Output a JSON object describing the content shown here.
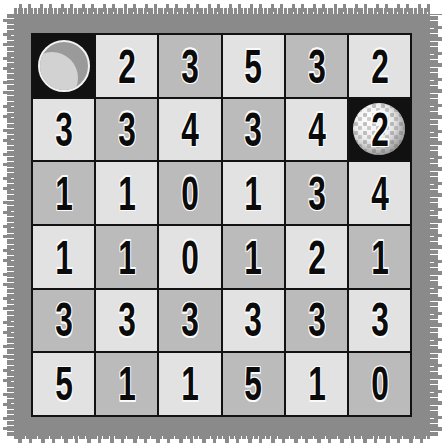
{
  "board": {
    "title": "number-grid-puzzle",
    "rows": 6,
    "columns": 6,
    "colors": {
      "frame": "#8a8a8a",
      "grid_line": "#121212",
      "cell_light": "#e2e2e2",
      "cell_dark": "#bbbbbb",
      "cell_marker_bg": "#111111",
      "digit": "#0b0b0b",
      "page_background": "#ffffff"
    },
    "cells": [
      [
        {
          "value": "",
          "shade": "black",
          "marker": "moon-icon"
        },
        {
          "value": "2",
          "shade": "light",
          "marker": ""
        },
        {
          "value": "3",
          "shade": "dark",
          "marker": ""
        },
        {
          "value": "5",
          "shade": "light",
          "marker": ""
        },
        {
          "value": "3",
          "shade": "dark",
          "marker": ""
        },
        {
          "value": "2",
          "shade": "light",
          "marker": ""
        }
      ],
      [
        {
          "value": "3",
          "shade": "light",
          "marker": ""
        },
        {
          "value": "3",
          "shade": "dark",
          "marker": ""
        },
        {
          "value": "4",
          "shade": "light",
          "marker": ""
        },
        {
          "value": "3",
          "shade": "dark",
          "marker": ""
        },
        {
          "value": "4",
          "shade": "light",
          "marker": ""
        },
        {
          "value": "2",
          "shade": "black",
          "marker": "golf-ball-icon"
        }
      ],
      [
        {
          "value": "1",
          "shade": "dark",
          "marker": ""
        },
        {
          "value": "1",
          "shade": "light",
          "marker": ""
        },
        {
          "value": "0",
          "shade": "dark",
          "marker": ""
        },
        {
          "value": "1",
          "shade": "light",
          "marker": ""
        },
        {
          "value": "3",
          "shade": "dark",
          "marker": ""
        },
        {
          "value": "4",
          "shade": "light",
          "marker": ""
        }
      ],
      [
        {
          "value": "1",
          "shade": "light",
          "marker": ""
        },
        {
          "value": "1",
          "shade": "dark",
          "marker": ""
        },
        {
          "value": "0",
          "shade": "light",
          "marker": ""
        },
        {
          "value": "1",
          "shade": "dark",
          "marker": ""
        },
        {
          "value": "2",
          "shade": "light",
          "marker": ""
        },
        {
          "value": "1",
          "shade": "dark",
          "marker": ""
        }
      ],
      [
        {
          "value": "3",
          "shade": "dark",
          "marker": ""
        },
        {
          "value": "3",
          "shade": "light",
          "marker": ""
        },
        {
          "value": "3",
          "shade": "dark",
          "marker": ""
        },
        {
          "value": "3",
          "shade": "light",
          "marker": ""
        },
        {
          "value": "3",
          "shade": "dark",
          "marker": ""
        },
        {
          "value": "3",
          "shade": "light",
          "marker": ""
        }
      ],
      [
        {
          "value": "5",
          "shade": "light",
          "marker": ""
        },
        {
          "value": "1",
          "shade": "dark",
          "marker": ""
        },
        {
          "value": "1",
          "shade": "light",
          "marker": ""
        },
        {
          "value": "5",
          "shade": "dark",
          "marker": ""
        },
        {
          "value": "1",
          "shade": "light",
          "marker": ""
        },
        {
          "value": "0",
          "shade": "dark",
          "marker": ""
        }
      ]
    ]
  }
}
